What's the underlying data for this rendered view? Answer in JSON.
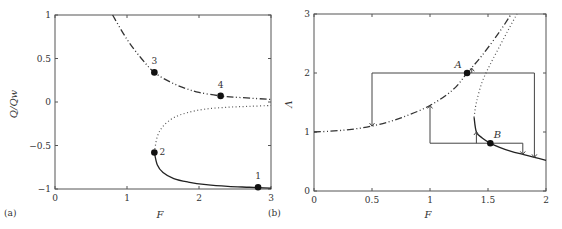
{
  "chart_data": [
    {
      "type": "line",
      "panel_label": "(a)",
      "xlabel": "F",
      "ylabel": "Q/Q_W",
      "xlim": [
        0,
        3
      ],
      "ylim": [
        -1,
        1
      ],
      "xticks": [
        "0",
        "1",
        "2",
        "3"
      ],
      "yticks": [
        "-1",
        "-0.5",
        "0",
        "0.5",
        "1"
      ],
      "grid": false,
      "series": [
        {
          "name": "upper branch (dash-dot)",
          "style": "dashdot",
          "x": [
            0.8,
            1.0,
            1.2,
            1.38,
            1.6,
            1.8,
            2.0,
            2.3,
            2.6,
            3.0
          ],
          "y": [
            1.0,
            0.72,
            0.5,
            0.34,
            0.23,
            0.16,
            0.11,
            0.07,
            0.05,
            0.03
          ]
        },
        {
          "name": "unstable branch (dotted)",
          "style": "dotted",
          "x": [
            1.38,
            1.42,
            1.5,
            1.65,
            1.85,
            2.1,
            2.4,
            2.7,
            3.0
          ],
          "y": [
            -0.58,
            -0.4,
            -0.28,
            -0.18,
            -0.12,
            -0.08,
            -0.06,
            -0.05,
            -0.04
          ]
        },
        {
          "name": "lower branch (solid)",
          "style": "solid",
          "x": [
            1.38,
            1.42,
            1.5,
            1.65,
            1.85,
            2.1,
            2.4,
            2.7,
            3.0
          ],
          "y": [
            -0.58,
            -0.72,
            -0.81,
            -0.88,
            -0.92,
            -0.95,
            -0.97,
            -0.98,
            -0.99
          ]
        }
      ],
      "points": [
        {
          "label": "1",
          "x": 2.82,
          "y": -0.98
        },
        {
          "label": "2",
          "x": 1.38,
          "y": -0.58
        },
        {
          "label": "3",
          "x": 1.38,
          "y": 0.34
        },
        {
          "label": "4",
          "x": 2.3,
          "y": 0.07
        }
      ]
    },
    {
      "type": "line",
      "panel_label": "(b)",
      "xlabel": "F",
      "ylabel": "Λ",
      "xlim": [
        0,
        2
      ],
      "ylim": [
        0,
        3
      ],
      "xticks": [
        "0",
        "0.5",
        "1",
        "1.5",
        "2"
      ],
      "yticks": [
        "0",
        "1",
        "2",
        "3"
      ],
      "grid": false,
      "series": [
        {
          "name": "upper branch (dash-dot)",
          "style": "dashdot",
          "x": [
            0,
            0.25,
            0.5,
            0.75,
            1.0,
            1.2,
            1.32,
            1.45,
            1.6,
            1.7
          ],
          "y": [
            1.0,
            1.03,
            1.1,
            1.24,
            1.45,
            1.72,
            2.0,
            2.3,
            2.7,
            3.0
          ]
        },
        {
          "name": "unstable branch (dotted)",
          "style": "dotted",
          "x": [
            1.38,
            1.4,
            1.45,
            1.52,
            1.6,
            1.68,
            1.75
          ],
          "y": [
            1.25,
            1.5,
            1.85,
            2.15,
            2.45,
            2.75,
            3.0
          ]
        },
        {
          "name": "lower branch (solid)",
          "style": "solid",
          "x": [
            1.38,
            1.4,
            1.45,
            1.52,
            1.6,
            1.7,
            1.8,
            1.9,
            2.0
          ],
          "y": [
            1.25,
            1.0,
            0.9,
            0.81,
            0.74,
            0.67,
            0.62,
            0.57,
            0.52
          ]
        }
      ],
      "points": [
        {
          "label": "A",
          "x": 1.32,
          "y": 2.0
        },
        {
          "label": "B",
          "x": 1.52,
          "y": 0.81
        }
      ],
      "annotations": [
        {
          "type": "hysteresis-path",
          "desc": "Λ=2 from F=0.5 to 1.9, drops at F=0.5 to curve (Λ≈1.1) and at F=1.9 to curve (Λ≈0.57); arrow up at A"
        },
        {
          "type": "hysteresis-path",
          "desc": "Λ≈0.81 from F=1 to 1.8, rises at F=1 to Λ≈1.45, arrow at F=1.4 up to Λ≈1.0, drops at F=1.8 to Λ≈0.62"
        }
      ]
    }
  ]
}
